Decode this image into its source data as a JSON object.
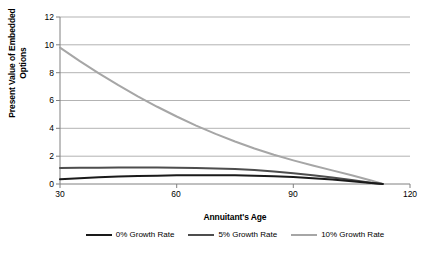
{
  "chart_data": {
    "type": "line",
    "title": "",
    "xlabel": "Annuitant's Age",
    "ylabel": "Present Value of Embedded Options",
    "ylabel_line1": "Present Value of Embedded",
    "ylabel_line2": "Options",
    "xlim": [
      30,
      120
    ],
    "ylim": [
      0,
      12
    ],
    "xticks": [
      30,
      60,
      90,
      120
    ],
    "yticks": [
      0,
      2,
      4,
      6,
      8,
      10,
      12
    ],
    "xtick_labels": [
      "30",
      "60",
      "90",
      "120"
    ],
    "ytick_labels": [
      "0",
      "2",
      "4",
      "6",
      "8",
      "10",
      "12"
    ],
    "grid": "horizontal",
    "legend_position": "bottom",
    "x": [
      30,
      35,
      40,
      45,
      50,
      55,
      60,
      65,
      70,
      75,
      80,
      85,
      90,
      95,
      100,
      105,
      110,
      113
    ],
    "series": [
      {
        "name": "0% Growth Rate",
        "color": "#1a1a1a",
        "width": 2.0,
        "values": [
          0.35,
          0.42,
          0.48,
          0.53,
          0.57,
          0.6,
          0.62,
          0.63,
          0.63,
          0.62,
          0.6,
          0.56,
          0.5,
          0.42,
          0.32,
          0.2,
          0.07,
          0.0
        ]
      },
      {
        "name": "5% Growth Rate",
        "color": "#4d4d4d",
        "width": 2.0,
        "values": [
          1.15,
          1.16,
          1.17,
          1.18,
          1.18,
          1.18,
          1.17,
          1.15,
          1.12,
          1.07,
          1.0,
          0.9,
          0.78,
          0.63,
          0.46,
          0.28,
          0.09,
          0.0
        ]
      },
      {
        "name": "10% Growth Rate",
        "color": "#a6a6a6",
        "width": 2.0,
        "values": [
          9.8,
          8.85,
          7.95,
          7.1,
          6.3,
          5.55,
          4.85,
          4.2,
          3.6,
          3.05,
          2.55,
          2.1,
          1.7,
          1.33,
          0.98,
          0.63,
          0.25,
          0.0
        ]
      }
    ]
  },
  "legend": {
    "items": [
      {
        "label": "0% Growth Rate",
        "color": "#1a1a1a"
      },
      {
        "label": "5% Growth Rate",
        "color": "#4d4d4d"
      },
      {
        "label": "10% Growth Rate",
        "color": "#a6a6a6"
      }
    ]
  },
  "axes": {
    "grid_color": "#b3b3b3",
    "axis_color": "#808080"
  }
}
